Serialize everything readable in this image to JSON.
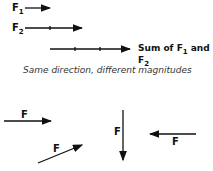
{
  "top": {
    "f1_label": "F",
    "f1_sub": "1",
    "f2_label": "F",
    "f2_sub": "2",
    "sum_label_prefix": "Sum of F",
    "sum_sub1": "1",
    "sum_mid": " and F",
    "sum_sub2": "2",
    "caption": "Same direction, different magnitudes"
  },
  "bottom": {
    "labels": [
      "F",
      "F",
      "F",
      "F"
    ]
  }
}
